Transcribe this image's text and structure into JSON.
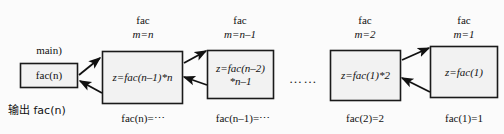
{
  "diagram": {
    "title_hidden": "",
    "caller": {
      "header_label": "main)",
      "box_text": "fac(n)",
      "footer_label": "输出 fac(n)"
    },
    "ellipsis": "……",
    "frames": [
      {
        "name": "fac",
        "state": "m=n",
        "body_line1": "z=fac(n–1)*n",
        "body_line2": "",
        "footer": "fac(n)=⋯"
      },
      {
        "name": "fac",
        "state": "m=n–1",
        "body_line1": "z=fac(n–2)",
        "body_line2": "*n–1",
        "footer": "fac(n–1)=⋯"
      },
      {
        "name": "fac",
        "state": "m=2",
        "body_line1": "z=fac(1)*2",
        "body_line2": "",
        "footer": "fac(2)=2"
      },
      {
        "name": "fac",
        "state": "m=1",
        "body_line1": "z=fac(1)",
        "body_line2": "",
        "footer": "fac(1)=1"
      }
    ],
    "colors": {
      "stroke": "#1a1a1a",
      "box_fill": "#f2f2f2",
      "background": "#fbfbfb",
      "text": "#111111"
    }
  }
}
